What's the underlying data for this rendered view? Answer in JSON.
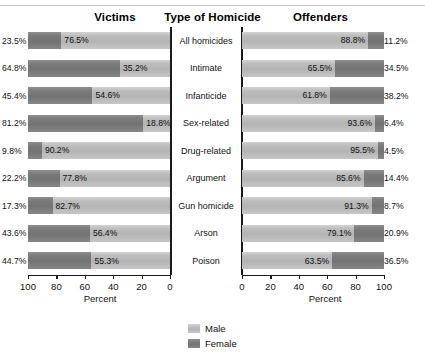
{
  "headers": {
    "victims": "Victims",
    "type": "Type of Homicide",
    "offenders": "Offenders"
  },
  "axis": {
    "left_title": "Percent",
    "right_title": "Percent",
    "left_ticks": [
      "100",
      "80",
      "60",
      "40",
      "20",
      "0"
    ],
    "right_ticks": [
      "0",
      "20",
      "40",
      "60",
      "80",
      "100"
    ]
  },
  "legend": {
    "male": "Male",
    "female": "Female"
  },
  "colors": {
    "male": "#bdbdbd",
    "female": "#7b7b7b",
    "axis": "#1a1a1a"
  },
  "chart_data": {
    "type": "bar",
    "title": "",
    "subtype": "paired horizontal stacked (100%) bars, back-to-back panels",
    "xlabel": "Percent",
    "ylabel": "Type of Homicide",
    "xlim": [
      0,
      100
    ],
    "grid": false,
    "legend_position": "bottom-center",
    "panels": [
      "Victims",
      "Offenders"
    ],
    "left_axis_reversed": true,
    "categories": [
      "All homicides",
      "Intimate",
      "Infanticide",
      "Sex-related",
      "Drug-related",
      "Argument",
      "Gun homicide",
      "Arson",
      "Poison"
    ],
    "series": [
      {
        "name": "Victims Female",
        "panel": "Victims",
        "gender": "Female",
        "values": [
          23.5,
          64.8,
          45.4,
          81.2,
          9.8,
          22.2,
          17.3,
          43.6,
          44.7
        ],
        "labels": [
          "23.5%",
          "64.8%",
          "45.4%",
          "81.2%",
          "9.8%",
          "22.2%",
          "17.3%",
          "43.6%",
          "44.7%"
        ]
      },
      {
        "name": "Victims Male",
        "panel": "Victims",
        "gender": "Male",
        "values": [
          76.5,
          35.2,
          54.6,
          18.8,
          90.2,
          77.8,
          82.7,
          56.4,
          55.3
        ],
        "labels": [
          "76.5%",
          "35.2%",
          "54.6%",
          "18.8%",
          "90.2%",
          "77.8%",
          "82.7%",
          "56.4%",
          "55.3%"
        ]
      },
      {
        "name": "Offenders Male",
        "panel": "Offenders",
        "gender": "Male",
        "values": [
          88.8,
          65.5,
          61.8,
          93.6,
          95.5,
          85.6,
          91.3,
          79.1,
          63.5
        ],
        "labels": [
          "88.8%",
          "65.5%",
          "61.8%",
          "93.6%",
          "95.5%",
          "85.6%",
          "91.3%",
          "79.1%",
          "63.5%"
        ]
      },
      {
        "name": "Offenders Female",
        "panel": "Offenders",
        "gender": "Female",
        "values": [
          11.2,
          34.5,
          38.2,
          6.4,
          4.5,
          14.4,
          8.7,
          20.9,
          36.5
        ],
        "labels": [
          "11.2%",
          "34.5%",
          "38.2%",
          "6.4%",
          "4.5%",
          "14.4%",
          "8.7%",
          "20.9%",
          "36.5%"
        ]
      }
    ]
  }
}
